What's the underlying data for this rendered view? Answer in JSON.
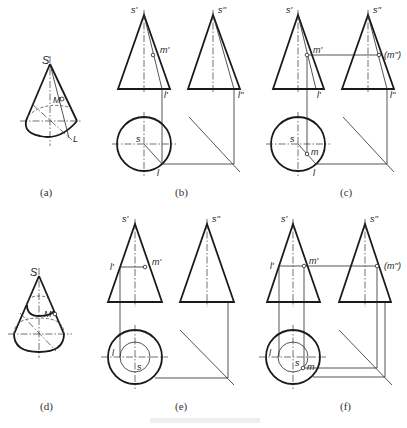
{
  "figure": {
    "caption": "",
    "panels": [
      {
        "id": "a",
        "caption": "(a)",
        "labels": {
          "apex": "S",
          "point": "M",
          "line": "L"
        }
      },
      {
        "id": "b",
        "caption": "(b)",
        "labels": {
          "front_apex": "s'",
          "side_apex": "s''",
          "front_point": "m'",
          "front_line": "l'",
          "side_line": "l''",
          "top_apex": "s",
          "top_line": "l"
        }
      },
      {
        "id": "c",
        "caption": "(c)",
        "labels": {
          "front_apex": "s'",
          "side_apex": "s''",
          "front_point": "m'",
          "side_point": "(m'')",
          "front_line": "l'",
          "side_line": "l''",
          "top_apex": "s",
          "top_point": "m",
          "top_line": "l"
        }
      },
      {
        "id": "d",
        "caption": "(d)",
        "labels": {
          "apex": "S",
          "point": "M"
        }
      },
      {
        "id": "e",
        "caption": "(e)",
        "labels": {
          "front_apex": "s'",
          "side_apex": "s''",
          "front_point": "m'",
          "front_line": "l'",
          "top_apex": "s",
          "top_line": "l"
        }
      },
      {
        "id": "f",
        "caption": "(f)",
        "labels": {
          "front_apex": "s'",
          "side_apex": "s''",
          "front_point": "m'",
          "side_point": "(m'')",
          "front_line": "l'",
          "top_apex": "s",
          "top_point": "m",
          "top_line": "l"
        }
      }
    ]
  }
}
